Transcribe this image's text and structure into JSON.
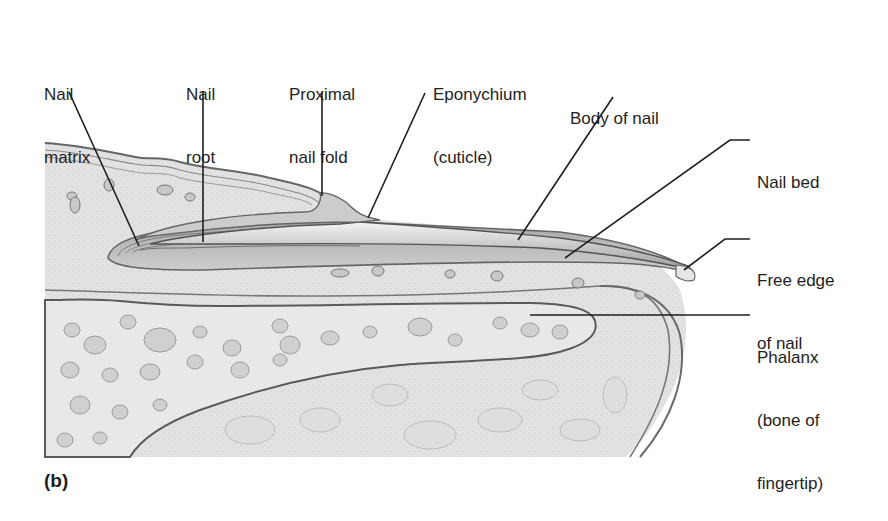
{
  "figure": {
    "panel_label": "(b)",
    "colors": {
      "background": "#ffffff",
      "tissue_fill": "#dcdcdc",
      "nail_fill": "#bdbdbd",
      "bone_fill": "#e6e6e6",
      "outline": "#555555",
      "leader": "#1e1e1e",
      "text": "#1e1e1e"
    }
  },
  "labels": [
    {
      "id": "nail-matrix",
      "line1": "Nail",
      "line2": "matrix"
    },
    {
      "id": "nail-root",
      "line1": "Nail",
      "line2": "root"
    },
    {
      "id": "proximal-nail-fold",
      "line1": "Proximal",
      "line2": "nail fold"
    },
    {
      "id": "eponychium",
      "line1": "Eponychium",
      "line2": "(cuticle)"
    },
    {
      "id": "body-of-nail",
      "line1": "Body of nail"
    },
    {
      "id": "nail-bed",
      "line1": "Nail bed"
    },
    {
      "id": "free-edge",
      "line1": "Free edge",
      "line2": "of nail"
    },
    {
      "id": "phalanx",
      "line1": "Phalanx",
      "line2": "(bone of",
      "line3": "fingertip)"
    }
  ]
}
